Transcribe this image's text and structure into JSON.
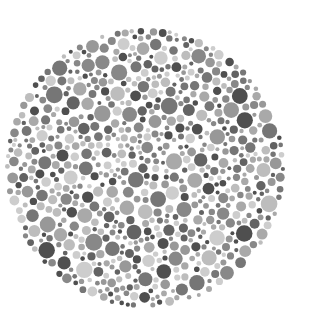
{
  "plate": {
    "type": "ishihara-style dot plate (grayscale)",
    "center_x": 145,
    "center_y": 168,
    "radius": 140,
    "background": "#ffffff",
    "dot_colors": [
      "#cdcdcd",
      "#bdbdbd",
      "#a9a9a9",
      "#989898",
      "#888888",
      "#767676",
      "#636363",
      "#4f4f4f"
    ],
    "min_dot_radius": 2,
    "max_dot_radius": 8.5,
    "seed": 1337
  }
}
